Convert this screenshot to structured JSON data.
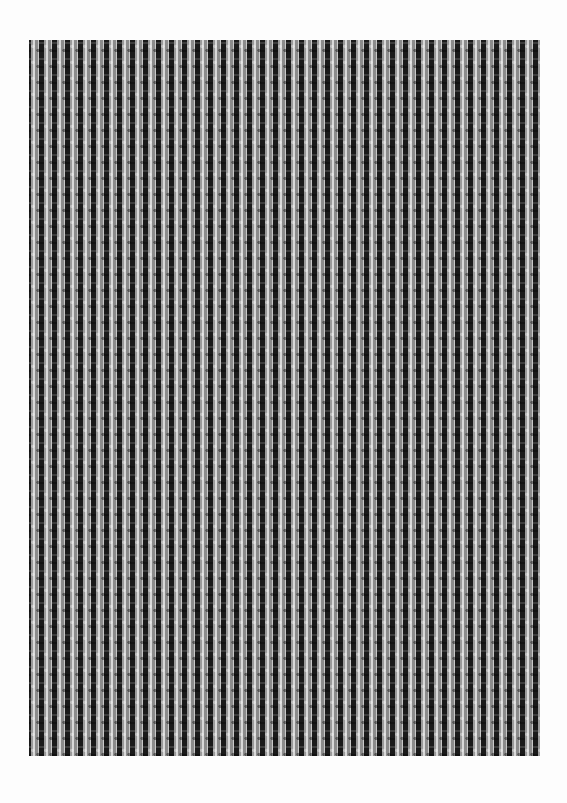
{
  "document": {
    "type": "scanned page",
    "content": "dense repeating textile-like weave pattern",
    "pattern": {
      "cell_width_px": 13,
      "cell_height_px": 16,
      "colors": {
        "background": "#ffffff",
        "dark": "#1a1a1a",
        "mid": "#9a9a9a",
        "light": "#d8d8d8"
      }
    }
  }
}
